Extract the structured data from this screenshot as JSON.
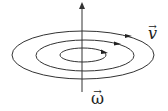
{
  "diagram": {
    "labels": {
      "velocity": "v",
      "angular_velocity": "ω",
      "vector_arrow": "→"
    },
    "colors": {
      "stroke": "#333333",
      "background": "#ffffff"
    }
  }
}
